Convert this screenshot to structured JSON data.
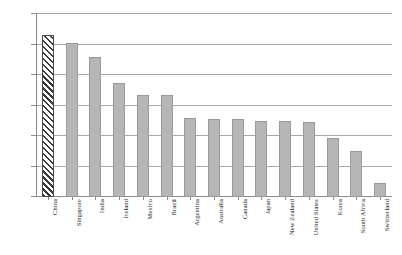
{
  "chart_data": {
    "type": "bar",
    "title": "",
    "subtitle": "",
    "xlabel": "",
    "ylabel": "",
    "ylim": [
      40,
      100
    ],
    "ytick_labels": [
      "100%",
      "90%",
      "80%",
      "70%",
      "60%",
      "50%",
      "40%"
    ],
    "ytick_values": [
      100,
      90,
      80,
      70,
      60,
      50,
      40
    ],
    "grid": true,
    "legend": "none",
    "categories": [
      "China",
      "Singapore",
      "India",
      "Iceland",
      "Mexico",
      "Brazil",
      "Argentina",
      "Australia",
      "Canada",
      "Japan",
      "New Zealand",
      "United States",
      "Korea",
      "South Africa",
      "Switzerland"
    ],
    "values": [
      93,
      90.5,
      86,
      77.5,
      73.5,
      73.5,
      66,
      65.5,
      65.5,
      65,
      65,
      64.5,
      59.5,
      55,
      44.5
    ],
    "highlight_index": 0,
    "highlight_style": "diagonal-hatch",
    "bar_color": "#b6b6b6",
    "bar_border_color": "#9a9a9a",
    "highlight_fill": "#ffffff",
    "highlight_stripe": "#3a3a3a",
    "gridline_color": "#a8a8a8",
    "axis_color": "#8a8a8a"
  }
}
